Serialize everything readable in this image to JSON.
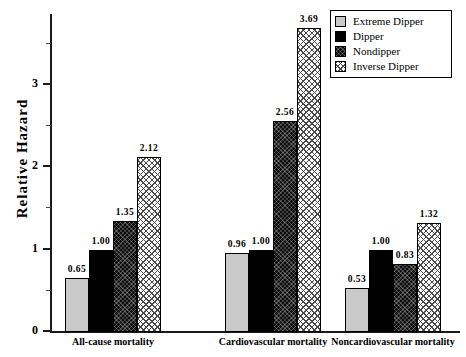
{
  "chart_data": {
    "type": "bar",
    "title": "",
    "xlabel": "",
    "ylabel": "Relative  Hazard",
    "ylim": [
      0,
      3.85
    ],
    "yticks": [
      0,
      1,
      2,
      3
    ],
    "ytick_labels": [
      "0",
      "1",
      "2",
      "3"
    ],
    "yminorticks": [
      0.5,
      1.5,
      2.5,
      3.5
    ],
    "grid": false,
    "legend_position": "top-right",
    "categories": [
      "All-cause mortality",
      "Cardiovascular mortality",
      "Noncardiovascular mortality"
    ],
    "series": [
      {
        "name": "Extreme Dipper",
        "swatch": "light-gray-solid",
        "color": "#c9c9c9",
        "values": [
          0.65,
          0.96,
          0.53
        ],
        "labels": [
          "0.65",
          "0.96",
          "0.53"
        ]
      },
      {
        "name": "Dipper",
        "swatch": "black-solid",
        "color": "#000000",
        "values": [
          1.0,
          1.0,
          1.0
        ],
        "labels": [
          "1.00",
          "1.00",
          "1.00"
        ]
      },
      {
        "name": "Nondipper",
        "swatch": "dark-crosshatch",
        "color": "#0d0d0d",
        "values": [
          1.35,
          2.56,
          0.83
        ],
        "labels": [
          "1.35",
          "2.56",
          "0.83"
        ]
      },
      {
        "name": "Inverse Dipper",
        "swatch": "white-crosshatch",
        "color": "#ffffff",
        "values": [
          2.12,
          3.69,
          1.32
        ],
        "labels": [
          "2.12",
          "3.69",
          "1.32"
        ]
      }
    ]
  },
  "legend": {
    "items": [
      {
        "label": "Extreme Dipper"
      },
      {
        "label": "Dipper"
      },
      {
        "label": "Nondipper"
      },
      {
        "label": "Inverse Dipper"
      }
    ]
  }
}
